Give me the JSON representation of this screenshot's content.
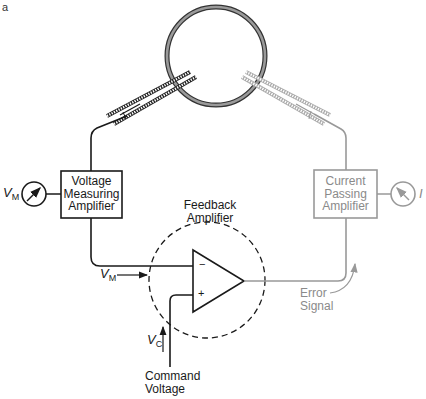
{
  "figure": {
    "panel_letter": "a"
  },
  "cell": {
    "stroke_color": "#555555",
    "fill_color": "#888888"
  },
  "voltage_measuring_amplifier": {
    "line1": "Voltage",
    "line2": "Measuring",
    "line3": "Amplifier",
    "meter_label": "V",
    "meter_subscript": "M"
  },
  "current_passing_amplifier": {
    "line1": "Current",
    "line2": "Passing",
    "line3": "Amplifier",
    "meter_label": "I",
    "color": "#8a8a8a"
  },
  "feedback_amplifier": {
    "line1": "Feedback",
    "line2": "Amplifier",
    "minus_symbol": "−",
    "plus_symbol": "+"
  },
  "inputs": {
    "vm_label": "V",
    "vm_subscript": "M",
    "vc_label": "V",
    "vc_subscript": "C",
    "command_line1": "Command",
    "command_line2": "Voltage"
  },
  "output": {
    "error_line1": "Error",
    "error_line2": "Signal"
  },
  "colors": {
    "black_path": "#1a1a1a",
    "gray_path": "#999999"
  }
}
